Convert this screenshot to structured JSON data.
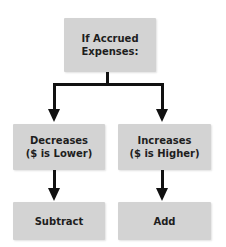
{
  "diagram": {
    "type": "flowchart",
    "root": {
      "line1": "If Accrued",
      "line2": "Expenses:"
    },
    "branches": [
      {
        "condition_line1": "Decreases",
        "condition_line2": "($ is Lower)",
        "action": "Subtract"
      },
      {
        "condition_line1": "Increases",
        "condition_line2": "($ is Higher)",
        "action": "Add"
      }
    ],
    "colors": {
      "box_fill": "#d3d3d3",
      "text": "#1e1e1e",
      "connector": "#111111",
      "background": "#ffffff"
    }
  }
}
